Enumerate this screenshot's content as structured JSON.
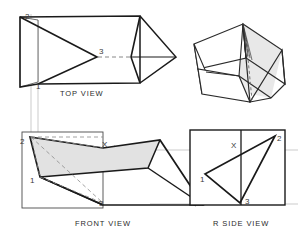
{
  "drawing": {
    "title_captions": {
      "top_view": "TOP VIEW",
      "front_view": "FRONT VIEW",
      "right_side_view": "R SIDE VIEW"
    },
    "colors": {
      "background": "#ffffff",
      "line": "#1a1a1a",
      "thin_line": "#4a4a4a",
      "projector_line": "#a9a9a9",
      "hidden_line": "#7a7a7a",
      "shade_fill": "#e2e2e2",
      "text": "#2b2b2b"
    },
    "views": {
      "top": {
        "name": "TOP VIEW",
        "labels": [
          {
            "text": "2",
            "x": 25,
            "y": 12
          },
          {
            "text": "1",
            "x": 36,
            "y": 82
          },
          {
            "text": "3",
            "x": 99,
            "y": 49
          }
        ]
      },
      "front": {
        "name": "FRONT VIEW",
        "labels": [
          {
            "text": "2",
            "x": 21,
            "y": 138
          },
          {
            "text": "1",
            "x": 31,
            "y": 178
          },
          {
            "text": "3",
            "x": 99,
            "y": 201
          },
          {
            "text": "X",
            "x": 103,
            "y": 143
          }
        ]
      },
      "rside": {
        "name": "R SIDE VIEW",
        "labels": [
          {
            "text": "2",
            "x": 277,
            "y": 140
          },
          {
            "text": "1",
            "x": 205,
            "y": 182
          },
          {
            "text": "3",
            "x": 246,
            "y": 198
          },
          {
            "text": "X",
            "x": 232,
            "y": 145
          }
        ]
      }
    }
  }
}
